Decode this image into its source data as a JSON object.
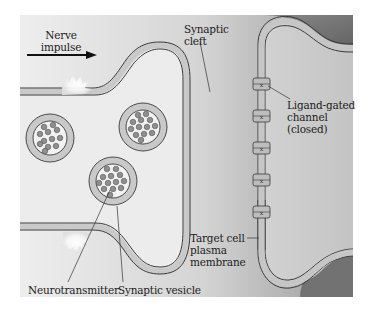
{
  "figure": {
    "type": "diagram",
    "colors": {
      "background": "#ffffff",
      "presynaptic_fill": "#ececec",
      "membrane_fill": "#c8c8c8",
      "membrane_outline": "#3a3a3a",
      "cleft_gradient_light": "#e6e6e6",
      "cleft_gradient_dark": "#8f8f8f",
      "postsynaptic_fill": "#cfcfcf",
      "outer_dark": "#6e6e6e",
      "neurotransmitter": "#8a8a8a"
    }
  },
  "labels": {
    "nerve_impulse_line1": "Nerve",
    "nerve_impulse_line2": "impulse",
    "synaptic_cleft_line1": "Synaptic",
    "synaptic_cleft_line2": "cleft",
    "ligand_channel_line1": "Ligand-gated",
    "ligand_channel_line2": "channel",
    "ligand_channel_line3": "(closed)",
    "target_membrane_line1": "Target cell",
    "target_membrane_line2": "plasma",
    "target_membrane_line3": "membrane",
    "neurotransmitter": "Neurotransmitter",
    "synaptic_vesicle": "Synaptic vesicle"
  }
}
